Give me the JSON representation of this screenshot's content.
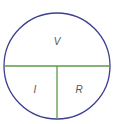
{
  "diagram": {
    "labels": {
      "top": "V",
      "bottom_left": "I",
      "bottom_right": "R"
    },
    "colors": {
      "circle": "#3b3f8f",
      "dividers": "#5a9a4a",
      "text": "#555555",
      "background": "#ffffff"
    }
  }
}
